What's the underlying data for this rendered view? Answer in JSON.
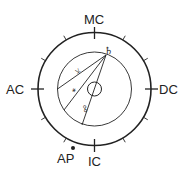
{
  "chart": {
    "angles": {
      "mc": "MC",
      "ac": "AC",
      "dc": "DC",
      "ic": "IC"
    },
    "point": {
      "label": "AP"
    },
    "planet": {
      "symbol": "♄",
      "name": "saturn"
    },
    "aspects": [
      {
        "symbol": "⚹",
        "name": "sextile"
      },
      {
        "symbol": "⚺",
        "name": "semi-sextile"
      },
      {
        "symbol": "☍",
        "name": "opposition"
      }
    ],
    "colors": {
      "stroke": "#222222",
      "background": "#ffffff"
    }
  }
}
